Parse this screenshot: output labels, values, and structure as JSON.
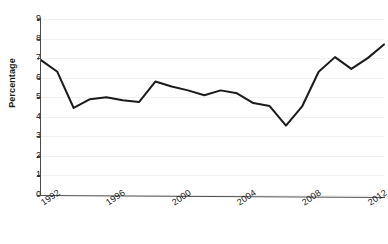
{
  "chart_data": {
    "type": "line",
    "title": "",
    "xlabel": "",
    "ylabel": "Percentage",
    "ylim": [
      0,
      9
    ],
    "xlim": [
      1992,
      2013
    ],
    "grid": true,
    "legend": false,
    "y_ticks": [
      9,
      8,
      7,
      6,
      5,
      4,
      3,
      2,
      1,
      0
    ],
    "x_tick_labels": [
      "1992",
      "1996",
      "2000",
      "2004",
      "2008",
      "2012"
    ],
    "x_tick_values": [
      1992,
      1996,
      2000,
      2004,
      2008,
      2012
    ],
    "x": [
      1992,
      1993,
      1994,
      1995,
      1996,
      1997,
      1998,
      1999,
      2000,
      2001,
      2002,
      2003,
      2004,
      2005,
      2006,
      2007,
      2008,
      2009,
      2010,
      2011,
      2012,
      2013
    ],
    "values": [
      6.9,
      6.3,
      4.45,
      4.9,
      5.0,
      4.85,
      4.75,
      5.8,
      5.55,
      5.35,
      5.1,
      5.35,
      5.2,
      4.7,
      4.55,
      3.55,
      4.55,
      6.3,
      7.05,
      6.45,
      7.0,
      7.7
    ],
    "series": [
      {
        "name": "Percentage",
        "color": "#1a1a1a",
        "values": [
          6.9,
          6.3,
          4.45,
          4.9,
          5.0,
          4.85,
          4.75,
          5.8,
          5.55,
          5.35,
          5.1,
          5.35,
          5.2,
          4.7,
          4.55,
          3.55,
          4.55,
          6.3,
          7.05,
          6.45,
          7.0,
          7.7
        ]
      }
    ]
  },
  "figure": {
    "title_text": "",
    "axis": {
      "y_title": "Percentage"
    },
    "colors": {
      "line": "#1a1a1a",
      "grid": "#f1f1f2",
      "axis": "#4a4a4a",
      "background": "#ffffff",
      "text": "#111111"
    }
  }
}
